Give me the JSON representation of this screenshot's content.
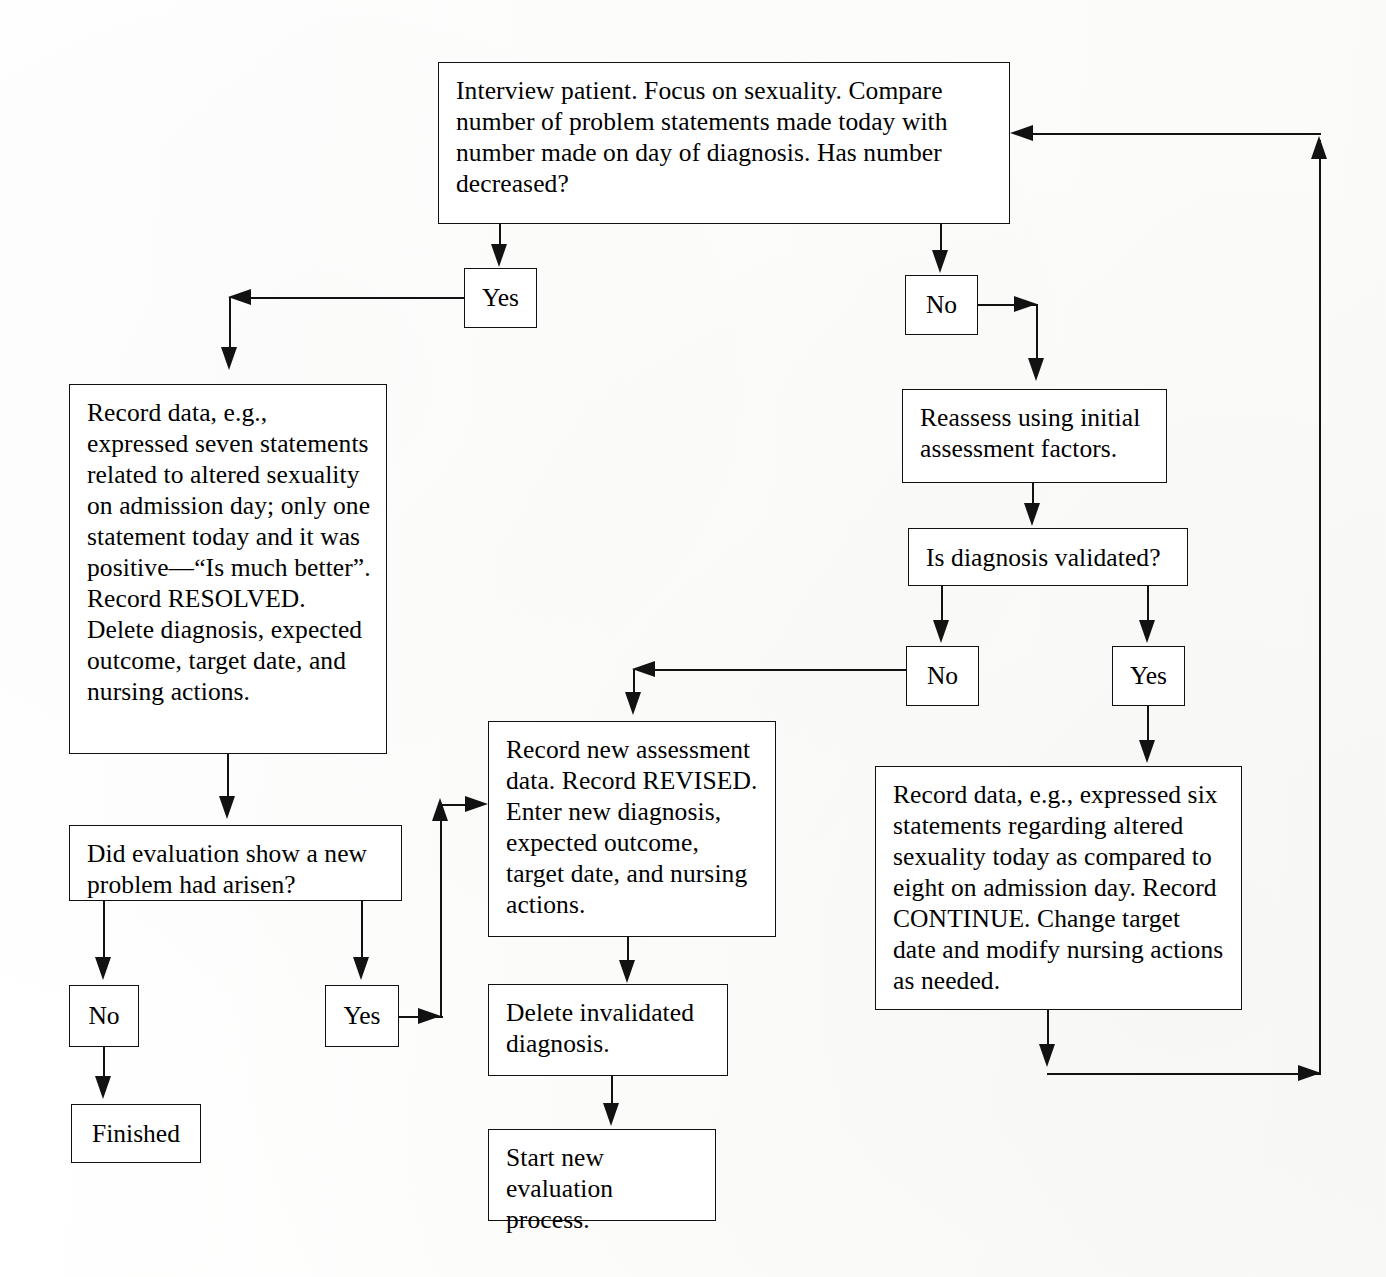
{
  "diagram": {
    "type": "flowchart",
    "nodes": {
      "interview": {
        "id": "interview",
        "shape": "process",
        "text": "Interview patient. Focus on sexuality. Compare number of problem statements made today with number made on day of diagnosis. Has number decreased?"
      },
      "yes_top": {
        "id": "yes_top",
        "shape": "label",
        "text": "Yes"
      },
      "no_top": {
        "id": "no_top",
        "shape": "label",
        "text": "No"
      },
      "record_resolved": {
        "id": "record_resolved",
        "shape": "process",
        "text": "Record data, e.g., expressed seven statements related to altered sexuality on admission day; only one statement today and it was positive—“Is much better”. Record RESOLVED. Delete diagnosis, expected outcome, target date, and nursing actions."
      },
      "reassess": {
        "id": "reassess",
        "shape": "process",
        "text": "Reassess using initial assessment factors."
      },
      "validated": {
        "id": "validated",
        "shape": "decision",
        "text": "Is diagnosis validated?"
      },
      "no_validated": {
        "id": "no_validated",
        "shape": "label",
        "text": "No"
      },
      "yes_validated": {
        "id": "yes_validated",
        "shape": "label",
        "text": "Yes"
      },
      "new_problem": {
        "id": "new_problem",
        "shape": "decision",
        "text": "Did evaluation show a new problem had arisen?"
      },
      "no_problem": {
        "id": "no_problem",
        "shape": "label",
        "text": "No"
      },
      "yes_problem": {
        "id": "yes_problem",
        "shape": "label",
        "text": "Yes"
      },
      "finished": {
        "id": "finished",
        "shape": "terminator",
        "text": "Finished"
      },
      "record_revised": {
        "id": "record_revised",
        "shape": "process",
        "text": "Record new assessment data. Record REVISED. Enter new diagnosis, expected outcome, target date, and nursing actions."
      },
      "delete_invalidated": {
        "id": "delete_invalidated",
        "shape": "process",
        "text": "Delete invalidated diagnosis."
      },
      "start_new": {
        "id": "start_new",
        "shape": "process",
        "text": "Start new evaluation process."
      },
      "record_continue": {
        "id": "record_continue",
        "shape": "process",
        "text": "Record data, e.g., expressed six statements regarding altered sexuality today as compared to eight on admission day. Record CONTINUE. Change target date and modify nursing actions as needed."
      }
    },
    "edges": [
      {
        "from": "interview",
        "to": "yes_top",
        "label": ""
      },
      {
        "from": "interview",
        "to": "no_top",
        "label": ""
      },
      {
        "from": "yes_top",
        "to": "record_resolved",
        "label": ""
      },
      {
        "from": "no_top",
        "to": "reassess",
        "label": ""
      },
      {
        "from": "reassess",
        "to": "validated",
        "label": ""
      },
      {
        "from": "validated",
        "to": "no_validated",
        "label": ""
      },
      {
        "from": "validated",
        "to": "yes_validated",
        "label": ""
      },
      {
        "from": "no_validated",
        "to": "record_revised",
        "label": ""
      },
      {
        "from": "yes_validated",
        "to": "record_continue",
        "label": ""
      },
      {
        "from": "record_resolved",
        "to": "new_problem",
        "label": ""
      },
      {
        "from": "new_problem",
        "to": "no_problem",
        "label": ""
      },
      {
        "from": "new_problem",
        "to": "yes_problem",
        "label": ""
      },
      {
        "from": "no_problem",
        "to": "finished",
        "label": ""
      },
      {
        "from": "yes_problem",
        "to": "record_revised",
        "label": ""
      },
      {
        "from": "record_revised",
        "to": "delete_invalidated",
        "label": ""
      },
      {
        "from": "delete_invalidated",
        "to": "start_new",
        "label": ""
      },
      {
        "from": "record_continue",
        "to": "interview",
        "label": ""
      }
    ],
    "colors": {
      "line": "#121212",
      "box_fill": "#ffffff",
      "text": "#000000",
      "background": "#fcfcfb"
    }
  }
}
